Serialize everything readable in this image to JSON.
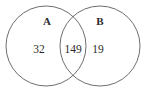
{
  "diagram": {
    "type": "venn-two-set",
    "background_color": "#ffffff",
    "stroke_color": "#5c5c5c",
    "text_color": "#2b2b2b",
    "stroke_width": 0.9,
    "sets": [
      {
        "id": "A",
        "label": "A",
        "label_x": 47,
        "label_y": 22,
        "circle": {
          "cx": 46,
          "cy": 46,
          "r": 40
        }
      },
      {
        "id": "B",
        "label": "B",
        "label_x": 100,
        "label_y": 22,
        "circle": {
          "cx": 100,
          "cy": 46,
          "r": 40
        }
      }
    ],
    "regions": [
      {
        "id": "a-only",
        "name": "A only",
        "value": "32",
        "x": 39,
        "y": 50
      },
      {
        "id": "intersection",
        "name": "A and B",
        "value": "149",
        "x": 73,
        "y": 50
      },
      {
        "id": "b-only",
        "name": "B only",
        "value": "19",
        "x": 98,
        "y": 50
      }
    ]
  }
}
